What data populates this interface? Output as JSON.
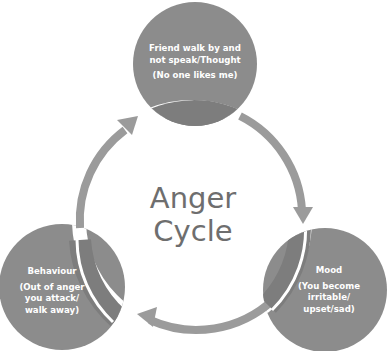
{
  "diagram": {
    "title_line1": "Anger",
    "title_line2": "Cycle",
    "nodes": [
      {
        "id": "thought",
        "heading": "Friend walk by and not speak/Thought",
        "heading_line1": "Friend walk by and",
        "heading_line2": "not speak/Thought",
        "detail": "(No one likes me)"
      },
      {
        "id": "mood",
        "heading": "Mood",
        "detail": "(You become irritable/ upset/sad)",
        "detail_line1": "(You become",
        "detail_line2": "irritable/",
        "detail_line3": "upset/sad)"
      },
      {
        "id": "behaviour",
        "heading": "Behaviour",
        "detail": "(Out of anger you attack/ walk away)",
        "detail_line1": "(Out of anger",
        "detail_line2": "you attack/",
        "detail_line3": "walk away)"
      }
    ],
    "flow": [
      "thought",
      "mood",
      "behaviour",
      "thought"
    ],
    "colors": {
      "node_fill": "#8c8c8c",
      "ring": "#9b9b9b",
      "overlap": "#7a7a7a",
      "title_text": "#6e6e6e",
      "node_text": "#ffffff"
    }
  }
}
